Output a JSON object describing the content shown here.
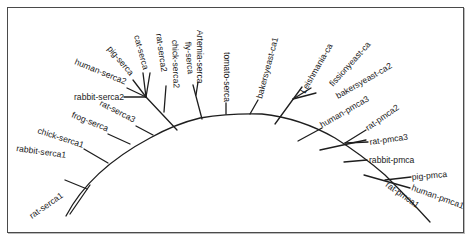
{
  "diagram": {
    "type": "phylogenetic-tree",
    "title": "",
    "labels": {
      "rat_serca1": "rat-serca1",
      "rabbit_serca1": "rabbit-serca1",
      "chick_serca1": "chick-serca1",
      "frog_serca": "frog-serca",
      "rat_serca3": "rat-serca3",
      "rabbit_serca2": "rabbit-serca2",
      "human_serca2": "human-serca2",
      "pig_serca": "pig-serca",
      "cat_serca": "cat-serca",
      "rat_serca2": "rat-serca2",
      "chick_serca2": "chick-serca2",
      "fly_serca": "fly-serca",
      "artemia_serca": "Artemia-serca",
      "tomato_serca": "tomato-serca",
      "bakersyeast_ca1": "bakersyeast-ca1",
      "leishmania_ca": "Leishmania-ca",
      "fissionyeast_ca": "fissionyeast-ca",
      "bakersyeast_ca2": "bakersyeast-ca2",
      "human_pmca3": "human-pmca3",
      "rat_pmca2": "rat-pmca2",
      "rat_pmca3": "rat-pmca3",
      "rabbit_pmca": "rabbit-pmca",
      "pig_pmca": "pig-pmca",
      "human_pmca1": "human-pmca1",
      "rat_pmca1": "rat-pmca1"
    }
  }
}
